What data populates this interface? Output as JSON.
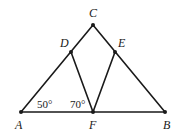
{
  "diagram": {
    "type": "geometry-triangle",
    "points": {
      "A": {
        "label": "A",
        "x": 21,
        "y": 112,
        "lx": 15,
        "ly": 129
      },
      "B": {
        "label": "B",
        "x": 165,
        "y": 112,
        "lx": 163,
        "ly": 129
      },
      "C": {
        "label": "C",
        "x": 93,
        "y": 25,
        "lx": 89,
        "ly": 17
      },
      "D": {
        "label": "D",
        "x": 71,
        "y": 52,
        "lx": 60,
        "ly": 47
      },
      "E": {
        "label": "E",
        "x": 115,
        "y": 52,
        "lx": 118,
        "ly": 47
      },
      "F": {
        "label": "F",
        "x": 93,
        "y": 112,
        "lx": 89,
        "ly": 129
      }
    },
    "segments": [
      [
        "A",
        "C"
      ],
      [
        "C",
        "B"
      ],
      [
        "A",
        "B"
      ],
      [
        "D",
        "F"
      ],
      [
        "E",
        "F"
      ]
    ],
    "angles": [
      {
        "label": "50°",
        "at": "A",
        "x": 37,
        "y": 108
      },
      {
        "label": "70°",
        "at": "F",
        "x": 70,
        "y": 108
      }
    ],
    "colors": {
      "stroke": "#1a1a1a",
      "background": "#ffffff"
    }
  }
}
